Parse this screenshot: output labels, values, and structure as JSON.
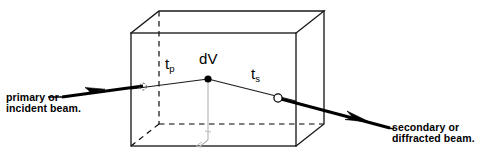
{
  "figure": {
    "background_color": "#ffffff",
    "line_color": "#000000",
    "faint_line_color": "#b0b0b0"
  },
  "labels": {
    "primary_beam": "primary or\nincident beam.",
    "secondary_beam": "secondary or\ndiffracted beam.",
    "t_p": "t",
    "t_p_sub": "p",
    "dv": "dV",
    "t_s": "t",
    "t_s_sub": "s"
  },
  "geometry": {
    "cube": {
      "front_top_left": [
        131,
        33
      ],
      "front_top_right": [
        296,
        33
      ],
      "front_bottom_left": [
        131,
        146
      ],
      "front_bottom_right": [
        296,
        146
      ],
      "back_top_left": [
        159,
        11
      ],
      "back_top_right": [
        324,
        11
      ],
      "back_bottom_left": [
        159,
        124
      ],
      "back_bottom_right": [
        324,
        124
      ],
      "hidden_edges": [
        "back-left-vertical",
        "back-bottom-left",
        "back-bottom-right"
      ]
    },
    "dv_point": [
      208,
      79
    ],
    "entry_point": [
      143,
      86
    ],
    "exit_point": [
      278,
      98
    ],
    "primary_beam_start": [
      62,
      97
    ],
    "primary_arrow_tip": [
      104,
      90
    ],
    "secondary_beam_end": [
      388,
      127
    ],
    "secondary_arrow_tip": [
      369,
      121
    ]
  },
  "colors": {
    "ink": "#000000",
    "faint": "#b3b3b3",
    "paper": "#ffffff"
  }
}
